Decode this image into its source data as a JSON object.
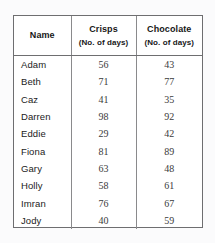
{
  "table": {
    "columns": [
      {
        "title": "Name",
        "subtitle": ""
      },
      {
        "title": "Crisps",
        "subtitle": "(No. of days)"
      },
      {
        "title": "Chocolate",
        "subtitle": "(No. of days)"
      }
    ],
    "rows": [
      {
        "name": "Adam",
        "crisps": "56",
        "chocolate": "43"
      },
      {
        "name": "Beth",
        "crisps": "71",
        "chocolate": "77"
      },
      {
        "name": "Caz",
        "crisps": "41",
        "chocolate": "35"
      },
      {
        "name": "Darren",
        "crisps": "98",
        "chocolate": "92"
      },
      {
        "name": "Eddie",
        "crisps": "29",
        "chocolate": "42"
      },
      {
        "name": "Fiona",
        "crisps": "81",
        "chocolate": "89"
      },
      {
        "name": "Gary",
        "crisps": "63",
        "chocolate": "48"
      },
      {
        "name": "Holly",
        "crisps": "58",
        "chocolate": "61"
      },
      {
        "name": "Imran",
        "crisps": "76",
        "chocolate": "67"
      },
      {
        "name": "Jody",
        "crisps": "40",
        "chocolate": "59"
      }
    ]
  },
  "colors": {
    "page_background": "#fbfbfc",
    "table_background": "#ffffff",
    "outer_border": "#6e6e70",
    "inner_rule": "#8a8a8c",
    "header_text": "#171717",
    "name_text": "#1b1b1b",
    "number_text": "#3a3a3a"
  }
}
